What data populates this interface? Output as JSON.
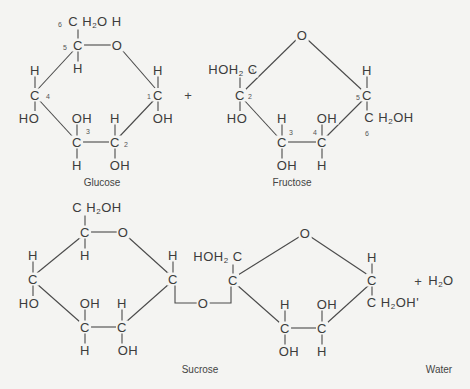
{
  "reaction": {
    "glucose": {
      "caption": "Glucose",
      "atoms": {
        "c6_group": "CH2OH",
        "c5": "C",
        "ring_o": "O",
        "c5_h": "H",
        "c4_h": "H",
        "c4": "C",
        "c4_oh": "HO",
        "c3_oh": "OH",
        "c3": "C",
        "c3_h": "H",
        "c2_h": "H",
        "c2": "C",
        "c2_oh": "OH",
        "c1_h": "H",
        "c1": "C",
        "c1_oh": "OH"
      },
      "numbers": {
        "n6": "6",
        "n5": "5",
        "n4": "4",
        "n3": "3",
        "n2": "2",
        "n1": "1"
      }
    },
    "plus_1": "+",
    "fructose": {
      "caption": "Fructose",
      "atoms": {
        "ring_o": "O",
        "c1_group": "HOH2C",
        "c2": "C",
        "c2_oh": "HO",
        "c3_h": "H",
        "c3": "C",
        "c3_oh": "OH",
        "c4_oh": "OH",
        "c4": "C",
        "c4_h": "H",
        "c5_h": "H",
        "c5": "C",
        "c6_group": "CH2OH"
      },
      "numbers": {
        "n1": "1",
        "n2": "2",
        "n3": "3",
        "n4": "4",
        "n5": "5",
        "n6": "6"
      }
    },
    "sucrose": {
      "caption": "Sucrose",
      "glucose_unit": {
        "c6_group": "CH2OH",
        "c5": "C",
        "ring_o": "O",
        "c5_h": "H",
        "c4_h": "H",
        "c4": "C",
        "c4_oh": "HO",
        "c3_oh": "OH",
        "c3": "C",
        "c3_h": "H",
        "c2_h": "H",
        "c2": "C",
        "c2_oh": "OH",
        "c1_h": "H",
        "c1": "C"
      },
      "bridge_o": "O",
      "fructose_unit": {
        "c1_group": "HOH2C",
        "c2": "C",
        "ring_o": "O",
        "c3_h": "H",
        "c3": "C",
        "c3_oh": "OH",
        "c4_oh": "OH",
        "c4": "C",
        "c4_h": "H",
        "c5_h": "H",
        "c5": "C",
        "c6_group": "CH2OH"
      }
    },
    "plus_2": "+",
    "water": {
      "formula": "H2O",
      "caption": "Water"
    }
  }
}
